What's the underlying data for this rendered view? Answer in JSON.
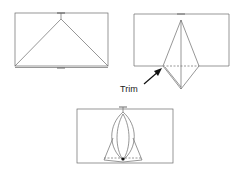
{
  "diagram": {
    "title": "",
    "steps": [
      {
        "id": 1,
        "description": "Rectangle with triangle fold lines from top center to bottom corners"
      },
      {
        "id": 2,
        "description": "Kite-shaped fold extending below rectangle"
      },
      {
        "id": 3,
        "description": "Curved petal folds with triangle base"
      }
    ],
    "annotations": {
      "trim_label": "Trim"
    },
    "colors": {
      "line": "#6a6a6a",
      "background": "#ffffff"
    }
  }
}
